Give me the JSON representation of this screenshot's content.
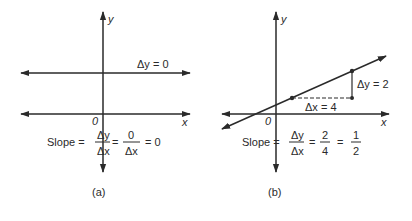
{
  "panel_a": {
    "caption": "(a)",
    "y_label": "y",
    "x_label": "x",
    "origin_label": "0",
    "delta_label": "Δy = 0",
    "slope": {
      "prefix": "Slope =",
      "frac1_num": "Δy",
      "frac1_den": "Δx",
      "eq1": "=",
      "frac2_num": "0",
      "frac2_den": "Δx",
      "eq2": "= 0"
    }
  },
  "panel_b": {
    "caption": "(b)",
    "y_label": "y",
    "x_label": "x",
    "origin_label": "0",
    "delta_y_label": "Δy = 2",
    "delta_x_label": "Δx = 4",
    "slope": {
      "prefix": "Slope =",
      "frac1_num": "Δy",
      "frac1_den": "Δx",
      "eq1": "=",
      "frac2_num": "2",
      "frac2_den": "4",
      "eq2": "=",
      "frac3_num": "1",
      "frac3_den": "2"
    }
  },
  "colors": {
    "ink": "#2a2a2a",
    "background": "#ffffff"
  }
}
